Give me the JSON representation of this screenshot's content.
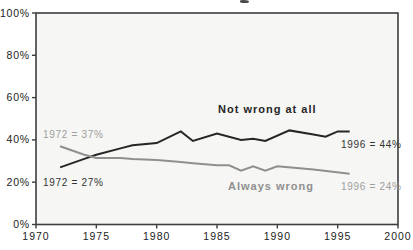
{
  "chart_data": {
    "type": "line",
    "title": "",
    "xlabel": "",
    "ylabel": "",
    "x_axis": {
      "min": 1970,
      "max": 2000,
      "ticks": [
        1970,
        1975,
        1980,
        1985,
        1990,
        1995,
        2000
      ],
      "tick_labels": [
        "1970",
        "1975",
        "1980",
        "1985",
        "1990",
        "1995",
        "2000"
      ]
    },
    "y_axis": {
      "min": 0,
      "max": 100,
      "ticks": [
        0,
        20,
        40,
        60,
        80,
        100
      ],
      "tick_labels": [
        "0%",
        "20%",
        "40%",
        "60%",
        "80%",
        "100%"
      ]
    },
    "series": [
      {
        "name": "Not wrong at all",
        "color": "#262626",
        "x": [
          1972,
          1974,
          1975,
          1977,
          1978,
          1980,
          1982,
          1983,
          1985,
          1987,
          1988,
          1989,
          1991,
          1993,
          1994,
          1995,
          1996
        ],
        "values": [
          27,
          31,
          33,
          36,
          37.5,
          38.5,
          44,
          39.5,
          43,
          40,
          40.5,
          39.5,
          44.5,
          42.5,
          41.5,
          44,
          44
        ]
      },
      {
        "name": "Always wrong",
        "color": "#8f8f8f",
        "x": [
          1972,
          1974,
          1975,
          1977,
          1978,
          1980,
          1982,
          1983,
          1985,
          1986,
          1987,
          1988,
          1989,
          1990,
          1993,
          1996
        ],
        "values": [
          37,
          33,
          31.5,
          31.5,
          31,
          30.5,
          29.5,
          29,
          28,
          28,
          25.5,
          27.5,
          25.5,
          27.5,
          26,
          24
        ]
      }
    ],
    "annotations": [
      {
        "text": "1972 = 37%",
        "color": "#9d9d9d",
        "bold": false
      },
      {
        "text": "1972 = 27%",
        "color": "#333333",
        "bold": false
      },
      {
        "text": "Not wrong at all",
        "color": "#262626",
        "bold": true
      },
      {
        "text": "1996 = 44%",
        "color": "#333333",
        "bold": false
      },
      {
        "text": "Always wrong",
        "color": "#8f8f8f",
        "bold": true
      },
      {
        "text": "1996 = 24%",
        "color": "#9d9d9d",
        "bold": false
      }
    ],
    "plot_background": "#f6f6f4",
    "border_color": "#3e3e3e",
    "axis_text_color": "#1c1c1c",
    "grid": false,
    "legend": "inline-labels"
  }
}
